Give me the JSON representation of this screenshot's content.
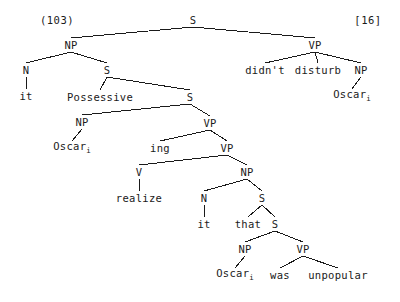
{
  "figure": {
    "left_label": "(103)",
    "right_label": "[16]",
    "type": "syntax-tree",
    "ink_color": "#1a1a1a",
    "background_color": "#ffffff"
  },
  "nodes": [
    {
      "id": "s-root",
      "label": "S",
      "x": 193,
      "y": 20,
      "kind": "category"
    },
    {
      "id": "np-subject",
      "label": "NP",
      "x": 71,
      "y": 45,
      "kind": "category"
    },
    {
      "id": "vp-matrix",
      "label": "VP",
      "x": 315,
      "y": 45,
      "kind": "category"
    },
    {
      "id": "n-it-1",
      "label": "N",
      "x": 26,
      "y": 70,
      "kind": "category"
    },
    {
      "id": "s-poss",
      "label": "S",
      "x": 107,
      "y": 70,
      "kind": "category"
    },
    {
      "id": "w-didnt",
      "label": "didn't",
      "x": 265,
      "y": 70,
      "kind": "terminal"
    },
    {
      "id": "w-disturb",
      "label": "disturb",
      "x": 318,
      "y": 70,
      "kind": "terminal"
    },
    {
      "id": "np-object",
      "label": "NP",
      "x": 361,
      "y": 70,
      "kind": "category"
    },
    {
      "id": "w-it-1",
      "label": "it",
      "x": 26,
      "y": 96,
      "kind": "terminal"
    },
    {
      "id": "w-possessive",
      "label": "Possessive",
      "x": 100,
      "y": 97,
      "kind": "terminal"
    },
    {
      "id": "s-embedded-1",
      "label": "S",
      "x": 190,
      "y": 97,
      "kind": "category"
    },
    {
      "id": "w-oscar-obj",
      "label": "Oscar",
      "sub": "i",
      "x": 352,
      "y": 96,
      "kind": "terminal"
    },
    {
      "id": "np-oscar-1",
      "label": "NP",
      "x": 82,
      "y": 122,
      "kind": "category"
    },
    {
      "id": "vp-ing",
      "label": "VP",
      "x": 210,
      "y": 123,
      "kind": "category"
    },
    {
      "id": "w-oscar-1",
      "label": "Oscar",
      "sub": "i",
      "x": 72,
      "y": 148,
      "kind": "terminal"
    },
    {
      "id": "w-ing",
      "label": "ing",
      "x": 160,
      "y": 148,
      "kind": "terminal"
    },
    {
      "id": "vp-realize",
      "label": "VP",
      "x": 227,
      "y": 148,
      "kind": "category"
    },
    {
      "id": "v-realize",
      "label": "V",
      "x": 139,
      "y": 172,
      "kind": "category"
    },
    {
      "id": "np-clause",
      "label": "NP",
      "x": 247,
      "y": 172,
      "kind": "category"
    },
    {
      "id": "w-realize",
      "label": "realize",
      "x": 139,
      "y": 198,
      "kind": "terminal"
    },
    {
      "id": "n-it-2",
      "label": "N",
      "x": 204,
      "y": 198,
      "kind": "category"
    },
    {
      "id": "s-that",
      "label": "S",
      "x": 262,
      "y": 198,
      "kind": "category"
    },
    {
      "id": "w-it-2",
      "label": "it",
      "x": 204,
      "y": 224,
      "kind": "terminal"
    },
    {
      "id": "w-that",
      "label": "that",
      "x": 248,
      "y": 224,
      "kind": "terminal"
    },
    {
      "id": "s-embedded-2",
      "label": "S",
      "x": 275,
      "y": 224,
      "kind": "category"
    },
    {
      "id": "np-oscar-2",
      "label": "NP",
      "x": 245,
      "y": 249,
      "kind": "category"
    },
    {
      "id": "vp-was",
      "label": "VP",
      "x": 303,
      "y": 249,
      "kind": "category"
    },
    {
      "id": "w-oscar-2",
      "label": "Oscar",
      "sub": "i",
      "x": 235,
      "y": 275,
      "kind": "terminal"
    },
    {
      "id": "w-was",
      "label": "was",
      "x": 280,
      "y": 275,
      "kind": "terminal"
    },
    {
      "id": "w-unpopular",
      "label": "unpopular",
      "x": 338,
      "y": 275,
      "kind": "terminal"
    }
  ],
  "edges": [
    {
      "from": "s-root",
      "to": "np-subject"
    },
    {
      "from": "s-root",
      "to": "vp-matrix"
    },
    {
      "from": "np-subject",
      "to": "n-it-1"
    },
    {
      "from": "np-subject",
      "to": "s-poss"
    },
    {
      "from": "n-it-1",
      "to": "w-it-1"
    },
    {
      "from": "s-poss",
      "to": "w-possessive"
    },
    {
      "from": "s-poss",
      "to": "s-embedded-1"
    },
    {
      "from": "vp-matrix",
      "to": "w-didnt"
    },
    {
      "from": "vp-matrix",
      "to": "w-disturb"
    },
    {
      "from": "vp-matrix",
      "to": "np-object"
    },
    {
      "from": "np-object",
      "to": "w-oscar-obj"
    },
    {
      "from": "s-embedded-1",
      "to": "np-oscar-1"
    },
    {
      "from": "s-embedded-1",
      "to": "vp-ing"
    },
    {
      "from": "np-oscar-1",
      "to": "w-oscar-1"
    },
    {
      "from": "vp-ing",
      "to": "w-ing"
    },
    {
      "from": "vp-ing",
      "to": "vp-realize"
    },
    {
      "from": "vp-realize",
      "to": "v-realize"
    },
    {
      "from": "vp-realize",
      "to": "np-clause"
    },
    {
      "from": "v-realize",
      "to": "w-realize"
    },
    {
      "from": "np-clause",
      "to": "n-it-2"
    },
    {
      "from": "np-clause",
      "to": "s-that"
    },
    {
      "from": "n-it-2",
      "to": "w-it-2"
    },
    {
      "from": "s-that",
      "to": "w-that"
    },
    {
      "from": "s-that",
      "to": "s-embedded-2"
    },
    {
      "from": "s-embedded-2",
      "to": "np-oscar-2"
    },
    {
      "from": "s-embedded-2",
      "to": "vp-was"
    },
    {
      "from": "np-oscar-2",
      "to": "w-oscar-2"
    },
    {
      "from": "vp-was",
      "to": "w-was"
    },
    {
      "from": "vp-was",
      "to": "w-unpopular"
    }
  ],
  "corner_labels": [
    {
      "id": "example-number",
      "text": "(103)",
      "x": 57,
      "y": 20
    },
    {
      "id": "citation-tag",
      "text": "[16]",
      "x": 368,
      "y": 20
    }
  ]
}
